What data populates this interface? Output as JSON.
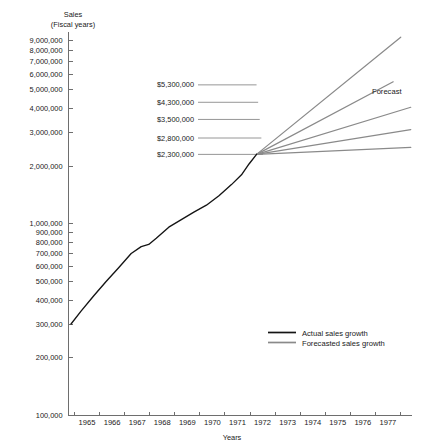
{
  "chart_data": {
    "type": "line",
    "title": "Sales",
    "subtitle": "(Fiscal years)",
    "ylabel": "Sales",
    "xlabel": "Years",
    "yscale": "log",
    "ylim": [
      100000,
      10000000
    ],
    "xlim": [
      1964.5,
      1978.2
    ],
    "grid": false,
    "legend_position": "lower-right",
    "ytick_labels": [
      "9,000,000",
      "8,000,000",
      "7,000,000",
      "6,000,000",
      "5,000,000",
      "4,000,000",
      "3,000,000",
      "2,000,000",
      "1,000,000",
      "900,000",
      "800,000",
      "700,000",
      "600,000",
      "500,000",
      "400,000",
      "300,000",
      "200,000",
      "100,000"
    ],
    "ytick_values": [
      9000000,
      8000000,
      7000000,
      6000000,
      5000000,
      4000000,
      3000000,
      2000000,
      1000000,
      900000,
      800000,
      700000,
      600000,
      500000,
      400000,
      300000,
      200000,
      100000
    ],
    "xtick_labels": [
      "1965",
      "1966",
      "1967",
      "1968",
      "1969",
      "1970",
      "1971",
      "1972",
      "1973",
      "1974",
      "1975",
      "1976",
      "1977"
    ],
    "xtick_values": [
      1965,
      1966,
      1967,
      1968,
      1969,
      1970,
      1971,
      1972,
      1973,
      1974,
      1975,
      1976,
      1977
    ],
    "series": [
      {
        "name": "Actual sales growth",
        "color": "#141414",
        "x": [
          1964.6,
          1965.0,
          1965.5,
          1966.0,
          1966.5,
          1967.0,
          1967.4,
          1967.7,
          1968.0,
          1968.5,
          1969.0,
          1969.5,
          1970.0,
          1970.5,
          1971.0,
          1971.4,
          1971.7,
          1972.0
        ],
        "values": [
          300000,
          350000,
          420000,
          500000,
          590000,
          700000,
          760000,
          780000,
          840000,
          960000,
          1050000,
          1150000,
          1250000,
          1400000,
          1600000,
          1800000,
          2050000,
          2300000
        ]
      },
      {
        "name": "Forecasted sales growth — $5,300,000",
        "color": "#8a8a8a",
        "x": [
          1972,
          1977.6
        ],
        "values": [
          2300000,
          9300000
        ],
        "end_label": "$5,300,000"
      },
      {
        "name": "Forecasted sales growth — $4,300,000",
        "color": "#8a8a8a",
        "x": [
          1972,
          1977.2
        ],
        "values": [
          2300000,
          5300000
        ],
        "end_label": "$4,300,000"
      },
      {
        "name": "Forecasted sales growth — $3,500,000",
        "color": "#8a8a8a",
        "x": [
          1972,
          1978.0
        ],
        "values": [
          2300000,
          4000000
        ],
        "end_label": "$3,500,000"
      }
    ],
    "annotations": [
      {
        "label": "$5,300,000",
        "y_value": 5300000
      },
      {
        "label": "$4,300,000",
        "y_value": 4300000
      },
      {
        "label": "$3,500,000",
        "y_value": 3500000
      },
      {
        "label": "$2,800,000",
        "y_value": 2800000
      },
      {
        "label": "$2,300,000",
        "y_value": 2300000
      }
    ],
    "forecast_tag": "Forecast",
    "legend": [
      {
        "label": "Actual sales growth",
        "color": "#141414"
      },
      {
        "label": "Forecasted sales growth",
        "color": "#8a8a8a"
      }
    ]
  }
}
